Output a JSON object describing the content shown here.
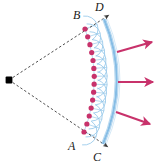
{
  "figure": {
    "background": "#ffffff",
    "width": 160,
    "height": 165
  },
  "colors": {
    "source_point": "#000000",
    "ray_line": "#3a3a3a",
    "wavefront_dot": "#c8326b",
    "wavelet": "#8fc4e8",
    "new_wavefront": "#7fb9e4",
    "propagation_arrow": "#c8326b"
  },
  "labels": {
    "a": "A",
    "b": "B",
    "c": "C",
    "d": "D"
  },
  "source": {
    "name": "point-source",
    "x": 9,
    "y": 80
  },
  "old_wavefront": {
    "name": "wavefront-AB",
    "endpoint_b": {
      "x": 85,
      "y": 29
    },
    "endpoint_a": {
      "x": 84,
      "y": 132
    },
    "dot_count": 14,
    "dot_radius": 2.6,
    "path": "M 85 29 Q 104 80 84 132"
  },
  "new_wavefront": {
    "name": "wavefront-CD",
    "endpoint_d": {
      "x": 104,
      "y": 19
    },
    "endpoint_c": {
      "x": 103,
      "y": 144
    },
    "path": "M 104 19 Q 130 81 103 144"
  },
  "rays": [
    {
      "name": "ray-to-B-D",
      "from": {
        "x": 9,
        "y": 80
      },
      "to": {
        "x": 109,
        "y": 15
      }
    },
    {
      "name": "ray-to-A-C",
      "from": {
        "x": 9,
        "y": 80
      },
      "to": {
        "x": 108,
        "y": 147
      }
    }
  ],
  "wavelet_radius": 13,
  "arrows": [
    {
      "name": "propagation-arrow-upper",
      "x1": 117,
      "y1": 52,
      "x2": 152,
      "y2": 42
    },
    {
      "name": "propagation-arrow-middle",
      "x1": 118,
      "y1": 82,
      "x2": 153,
      "y2": 82
    },
    {
      "name": "propagation-arrow-lower",
      "x1": 116,
      "y1": 112,
      "x2": 150,
      "y2": 124
    }
  ]
}
